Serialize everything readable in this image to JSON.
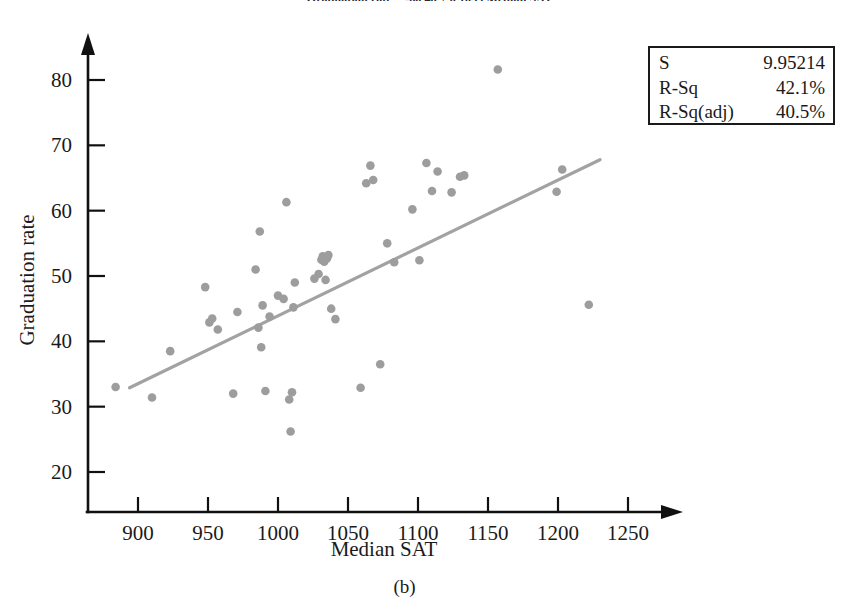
{
  "figure": {
    "caption": "(b)",
    "title": "Graduation rate = -60.46 + 0.1039 Median SAT"
  },
  "legend": {
    "rows": [
      {
        "key": "S",
        "value": "9.95214"
      },
      {
        "key": "R-Sq",
        "value": "42.1%"
      },
      {
        "key": "R-Sq(adj)",
        "value": "40.5%"
      }
    ]
  },
  "chart_data": {
    "type": "scatter",
    "title": "Graduation rate = -60.46 + 0.1039 Median SAT",
    "xlabel": "Median SAT",
    "ylabel": "Graduation rate",
    "xlim": [
      875,
      1265
    ],
    "ylim": [
      17,
      84
    ],
    "xticks": [
      900,
      950,
      1000,
      1050,
      1100,
      1150,
      1200,
      1250
    ],
    "yticks": [
      20,
      30,
      40,
      50,
      60,
      70,
      80
    ],
    "xticklabels": [
      "900",
      "950",
      "1000",
      "1050",
      "1100",
      "1150",
      "1200",
      "1250"
    ],
    "yticklabels": [
      "20",
      "30",
      "40",
      "50",
      "60",
      "70",
      "80"
    ],
    "grid": false,
    "legend_position": "top-right",
    "point_color": "#9d9d9d",
    "line_color": "#a2a2a2",
    "series": [
      {
        "name": "Colleges",
        "x": [
          884,
          910,
          923,
          948,
          951,
          953,
          957,
          968,
          971,
          984,
          986,
          987,
          988,
          989,
          991,
          994,
          1000,
          1004,
          1006,
          1008,
          1009,
          1010,
          1011,
          1012,
          1026,
          1029,
          1031,
          1032,
          1033,
          1034,
          1035,
          1036,
          1038,
          1041,
          1059,
          1063,
          1066,
          1068,
          1073,
          1078,
          1083,
          1096,
          1101,
          1106,
          1110,
          1114,
          1124,
          1130,
          1133,
          1157,
          1199,
          1203,
          1222
        ],
        "y": [
          33.0,
          31.4,
          38.5,
          48.3,
          42.9,
          43.5,
          41.8,
          32.0,
          44.5,
          51.0,
          42.1,
          56.8,
          39.1,
          45.5,
          32.4,
          43.8,
          47.0,
          46.5,
          61.3,
          31.1,
          26.2,
          32.2,
          45.2,
          49.0,
          49.6,
          50.3,
          52.5,
          53.0,
          52.2,
          49.4,
          52.7,
          53.2,
          45.0,
          43.4,
          32.9,
          64.2,
          66.9,
          64.7,
          36.5,
          55.0,
          52.1,
          60.2,
          52.4,
          67.3,
          63.0,
          66.0,
          62.8,
          65.2,
          65.4,
          81.6,
          62.9,
          66.3,
          45.6
        ]
      }
    ],
    "fit_line": {
      "name": "Regression line",
      "x_start": 894,
      "y_start": 32.9,
      "x_end": 1230,
      "y_end": 67.8
    }
  },
  "axes": {
    "x_title": "Median SAT",
    "y_title": "Graduation rate"
  }
}
